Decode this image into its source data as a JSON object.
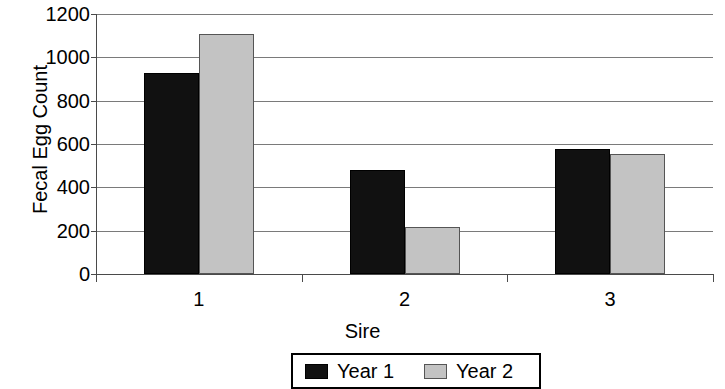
{
  "chart_data": {
    "type": "bar",
    "title": "",
    "xlabel": "Sire",
    "ylabel": "Fecal Egg Count",
    "categories": [
      "1",
      "2",
      "3"
    ],
    "series": [
      {
        "name": "Year 1",
        "color": "#111111",
        "values": [
          930,
          478,
          575
        ]
      },
      {
        "name": "Year 2",
        "color": "#c3c3c3",
        "values": [
          1110,
          218,
          552
        ]
      }
    ],
    "ylim": [
      0,
      1200
    ],
    "yticks": [
      0,
      200,
      400,
      600,
      800,
      1000,
      1200
    ],
    "ytick_labels": [
      "0",
      "200",
      "400",
      "600",
      "800",
      "1000",
      "1200"
    ],
    "grid": true,
    "legend_position": "bottom",
    "legend_entries": [
      "Year 1",
      "Year 2"
    ]
  }
}
